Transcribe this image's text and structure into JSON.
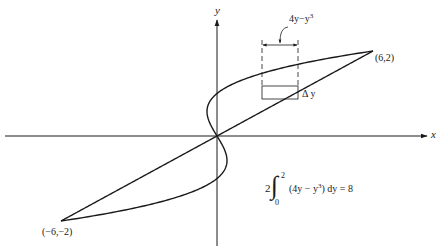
{
  "figure": {
    "axes": {
      "x_label": "x",
      "y_label": "y"
    },
    "points": [
      {
        "label": "(6,2)",
        "x": 6,
        "y": 2
      },
      {
        "label": "(−6,−2)",
        "x": -6,
        "y": -2
      }
    ],
    "curves": [
      {
        "name": "line",
        "equation": "x = 3y"
      },
      {
        "name": "cubic",
        "equation": "x = y^3 - y"
      }
    ],
    "strip": {
      "width_label_base": "4y−y",
      "width_label_exp": "3",
      "height_label": "Δ y"
    },
    "integral": {
      "coefficient": "2",
      "upper": "2",
      "lower": "0",
      "integrand_prefix": "(4y − y",
      "integrand_exp": "3",
      "integrand_suffix": ") dy = 8"
    },
    "stroke_color": "#1a1a1a"
  }
}
